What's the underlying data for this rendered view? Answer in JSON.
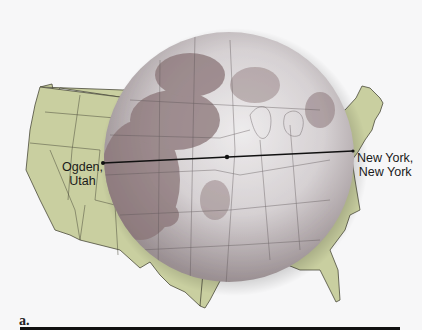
{
  "figure": {
    "panel_label": "a.",
    "labels": {
      "ogden": "Ogden,\nUtah",
      "ogden_line1": "Ogden,",
      "ogden_line2": "Utah",
      "newyork_line1": "New York,",
      "newyork_line2": "New York"
    },
    "elements": [
      "us-map",
      "moon",
      "distance-line",
      "midpoint-dot"
    ],
    "colors": {
      "background": "#f7f7f8",
      "land": "#c9cfa0",
      "border": "#4a4a3a",
      "moon_base": "#bfb8ba",
      "moon_maria": "#8a7577",
      "line": "#111111"
    }
  }
}
